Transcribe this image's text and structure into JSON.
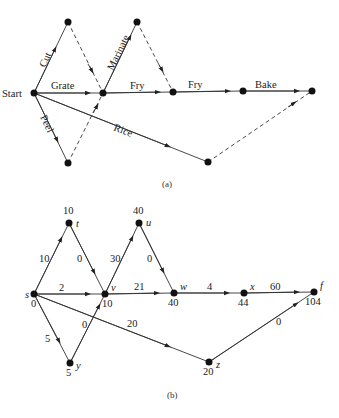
{
  "diagram_a": {
    "caption": "(a)",
    "start_label": "Start",
    "edges": {
      "cut": "Cut",
      "grate": "Grate",
      "peel": "Peel",
      "marinate": "Marinate",
      "fry1": "Fry",
      "fry2": "Fry",
      "bake": "Bake",
      "rice": "Rice"
    }
  },
  "diagram_b": {
    "caption": "(b)",
    "nodes": {
      "s": {
        "name": "s",
        "value": "0"
      },
      "t": {
        "name": "t",
        "value": "10"
      },
      "v": {
        "name": "v",
        "value": "10"
      },
      "u": {
        "name": "u",
        "value": "40"
      },
      "w": {
        "name": "w",
        "value": "40"
      },
      "x": {
        "name": "x",
        "value": "44"
      },
      "f": {
        "name": "f",
        "value": "104"
      },
      "y": {
        "name": "y",
        "value": "5"
      },
      "z": {
        "name": "z",
        "value": "20"
      }
    },
    "edges": {
      "st": "10",
      "tv": "0",
      "sv": "2",
      "sy": "5",
      "yv": "0",
      "vu": "30",
      "uw": "0",
      "vw": "21",
      "wx": "4",
      "xf": "60",
      "sz": "20",
      "zf": "0"
    }
  }
}
